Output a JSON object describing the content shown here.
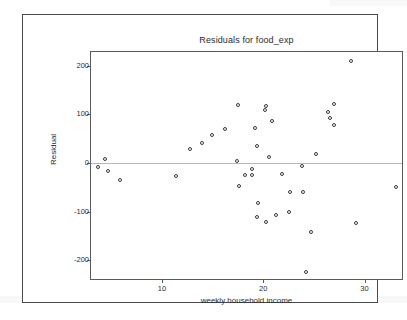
{
  "chart_data": {
    "type": "scatter",
    "title": "Residuals for food_exp",
    "xlabel": "weekly household income",
    "ylabel": "Residual",
    "xlim": [
      3.0,
      33.7
    ],
    "ylim": [
      -238,
      228
    ],
    "xticks": [
      10,
      20,
      30
    ],
    "yticks": [
      200,
      100,
      0,
      -100,
      -200
    ],
    "grid": false,
    "legend": null,
    "reference_line": {
      "y": 0,
      "color": "#b9b9b9"
    },
    "marker": {
      "shape": "open-circle",
      "color": "#3a3a3a",
      "size": 4
    },
    "points": [
      {
        "x": 3.7,
        "y": -8
      },
      {
        "x": 4.4,
        "y": 9
      },
      {
        "x": 4.7,
        "y": -16
      },
      {
        "x": 5.9,
        "y": -34
      },
      {
        "x": 11.4,
        "y": -27
      },
      {
        "x": 12.8,
        "y": 28
      },
      {
        "x": 14.0,
        "y": 41
      },
      {
        "x": 14.9,
        "y": 57
      },
      {
        "x": 16.2,
        "y": 69
      },
      {
        "x": 17.4,
        "y": 5
      },
      {
        "x": 17.5,
        "y": 119
      },
      {
        "x": 17.6,
        "y": -47
      },
      {
        "x": 18.2,
        "y": -25
      },
      {
        "x": 18.9,
        "y": -12
      },
      {
        "x": 18.9,
        "y": -24
      },
      {
        "x": 19.2,
        "y": 72
      },
      {
        "x": 19.4,
        "y": 36
      },
      {
        "x": 19.5,
        "y": -83
      },
      {
        "x": 19.4,
        "y": -111
      },
      {
        "x": 20.2,
        "y": 108
      },
      {
        "x": 20.3,
        "y": 118
      },
      {
        "x": 20.3,
        "y": -120
      },
      {
        "x": 20.6,
        "y": 13
      },
      {
        "x": 20.9,
        "y": 86
      },
      {
        "x": 21.3,
        "y": -106
      },
      {
        "x": 21.9,
        "y": -22
      },
      {
        "x": 22.5,
        "y": -100
      },
      {
        "x": 22.6,
        "y": -59
      },
      {
        "x": 23.8,
        "y": -5
      },
      {
        "x": 23.9,
        "y": -59
      },
      {
        "x": 24.2,
        "y": -223
      },
      {
        "x": 24.7,
        "y": -141
      },
      {
        "x": 25.2,
        "y": 18
      },
      {
        "x": 26.4,
        "y": 105
      },
      {
        "x": 26.6,
        "y": 93
      },
      {
        "x": 27.0,
        "y": 121
      },
      {
        "x": 27.0,
        "y": 79
      },
      {
        "x": 28.7,
        "y": 210
      },
      {
        "x": 29.2,
        "y": -124
      },
      {
        "x": 33.1,
        "y": -50
      }
    ]
  }
}
